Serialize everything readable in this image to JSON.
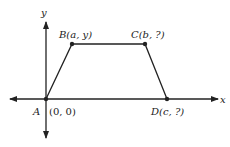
{
  "axes": {
    "x_label": "x",
    "y_label": "y"
  },
  "points": {
    "A": {
      "name": "A",
      "coords": "(0, 0)"
    },
    "B": {
      "name": "B",
      "coords": "(a, y)",
      "label": "B(a, y)"
    },
    "C": {
      "name": "C",
      "coords": "(b, ?)",
      "label": "C(b, ?)"
    },
    "D": {
      "name": "D",
      "coords": "(c, ?)",
      "label": "D(c, ?)"
    }
  },
  "colors": {
    "line": "#222222",
    "background": "#ffffff"
  }
}
